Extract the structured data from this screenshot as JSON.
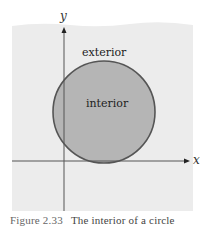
{
  "diagram": {
    "colors": {
      "background": "#ffffff",
      "region": "#ececec",
      "interior_fill": "#b5b5b5",
      "circle_stroke": "#555555",
      "axis": "#444444",
      "text": "#222222"
    },
    "axes": {
      "x_label": "x",
      "y_label": "y"
    },
    "labels": {
      "exterior": "exterior",
      "interior": "interior"
    },
    "circle": {
      "cx": 104,
      "cy": 112,
      "r": 51
    }
  },
  "caption": {
    "figure_number": "Figure 2.33",
    "text": "The interior of a circle"
  }
}
